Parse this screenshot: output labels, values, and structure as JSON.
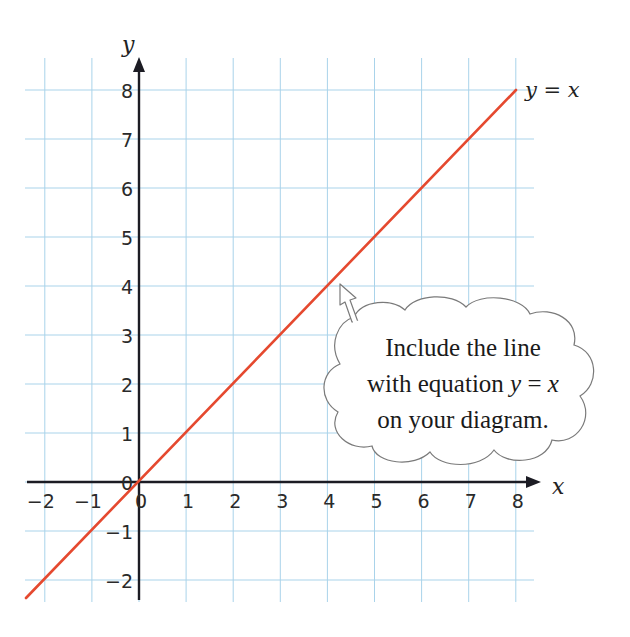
{
  "chart_data": {
    "type": "line",
    "title": "",
    "xlabel": "x",
    "ylabel": "y",
    "xlim": [
      -2.4,
      8.4
    ],
    "ylim": [
      -2.5,
      8.6
    ],
    "grid": true,
    "x_ticks": [
      "−2",
      "−1",
      "0",
      "1",
      "2",
      "3",
      "4",
      "5",
      "6",
      "7",
      "8"
    ],
    "y_ticks": [
      "−2",
      "−1",
      "0",
      "1",
      "2",
      "3",
      "4",
      "5",
      "6",
      "7",
      "8"
    ],
    "series": [
      {
        "name": "y = x",
        "color": "#e5492f",
        "x": [
          -2.4,
          -2,
          -1,
          0,
          1,
          2,
          3,
          4,
          5,
          6,
          7,
          8
        ],
        "y": [
          -2.4,
          -2,
          -1,
          0,
          1,
          2,
          3,
          4,
          5,
          6,
          7,
          8
        ]
      }
    ],
    "annotations": [
      {
        "text": "y = x",
        "at": [
          8,
          8
        ],
        "position": "right"
      },
      {
        "text": "Include the line with equation y = x on your diagram.",
        "type": "callout-cloud",
        "points_to": [
          4.2,
          4.2
        ]
      }
    ]
  },
  "axes": {
    "x_label": "x",
    "y_label": "y",
    "origin_label": "0"
  },
  "line_label": {
    "lhs": "y",
    "eq": " = ",
    "rhs": "x"
  },
  "callout": {
    "line1": "Include the line",
    "line2_prefix": "with equation ",
    "line2_var1": "y",
    "line2_eq": " = ",
    "line2_var2": "x",
    "line3": "on your diagram."
  },
  "colors": {
    "grid": "#a9d3ea",
    "axis": "#1c1c24",
    "line": "#e5492f"
  }
}
